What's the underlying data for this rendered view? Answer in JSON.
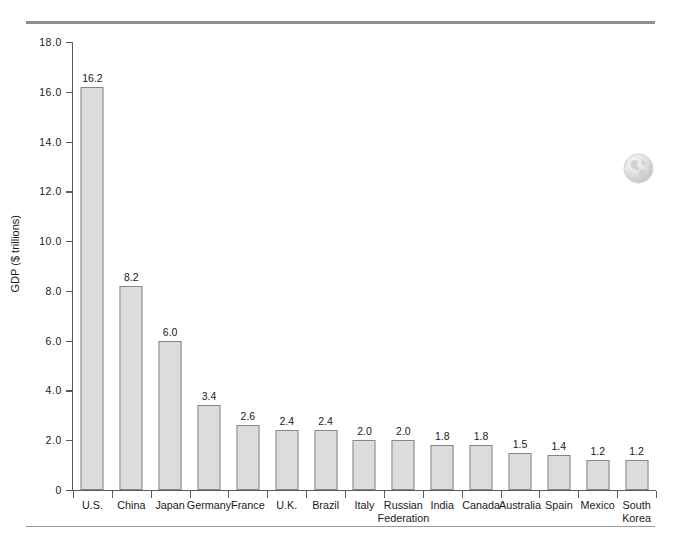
{
  "figure": {
    "top_rule": "",
    "bottom_rule": "",
    "globe_icon": "globe-icon"
  },
  "chart_data": {
    "type": "bar",
    "title": "",
    "subtitle": "",
    "xlabel": "",
    "ylabel": "GDP ($ trillions)",
    "ylim": [
      0,
      18
    ],
    "grid": false,
    "legend": "none",
    "ytick_labels": [
      "0",
      "2.0",
      "4.0",
      "6.0",
      "8.0",
      "10.0",
      "12.0",
      "14.0",
      "16.0",
      "18.0"
    ],
    "ytick_values": [
      0,
      2,
      4,
      6,
      8,
      10,
      12,
      14,
      16,
      18
    ],
    "categories": [
      "U.S.",
      "China",
      "Japan",
      "Germany",
      "France",
      "U.K.",
      "Brazil",
      "Italy",
      "Russian Federation",
      "India",
      "Canada",
      "Australia",
      "Spain",
      "Mexico",
      "South Korea"
    ],
    "category_lines": [
      [
        "U.S."
      ],
      [
        "China"
      ],
      [
        "Japan"
      ],
      [
        "Germany"
      ],
      [
        "France"
      ],
      [
        "U.K."
      ],
      [
        "Brazil"
      ],
      [
        "Italy"
      ],
      [
        "Russian",
        "Federation"
      ],
      [
        "India"
      ],
      [
        "Canada"
      ],
      [
        "Australia"
      ],
      [
        "Spain"
      ],
      [
        "Mexico"
      ],
      [
        "South",
        "Korea"
      ]
    ],
    "values": [
      16.2,
      8.2,
      6.0,
      3.4,
      2.6,
      2.4,
      2.4,
      2.0,
      2.0,
      1.8,
      1.8,
      1.5,
      1.4,
      1.2,
      1.2
    ],
    "value_labels": [
      "16.2",
      "8.2",
      "6.0",
      "3.4",
      "2.6",
      "2.4",
      "2.4",
      "2.0",
      "2.0",
      "1.8",
      "1.8",
      "1.5",
      "1.4",
      "1.2",
      "1.2"
    ],
    "colors": {
      "bar_fill": "#dcdcdc",
      "bar_stroke": "#878787",
      "axis": "#5a5a5a",
      "text": "#1a1a1a",
      "rule": "#8e8e8e"
    }
  }
}
